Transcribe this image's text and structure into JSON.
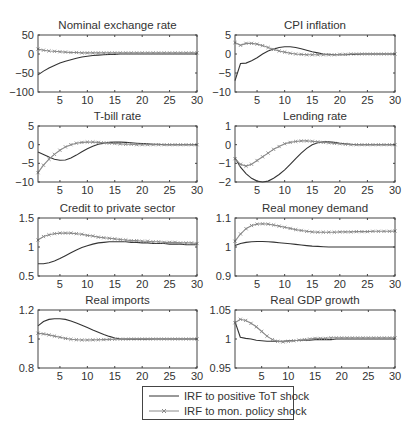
{
  "chart_data": [
    {
      "type": "line",
      "title": "Nominal exchange rate",
      "xlabel": "",
      "ylabel": "",
      "xlim": [
        1,
        30
      ],
      "ylim": [
        -100,
        50
      ],
      "xticks": [
        5,
        10,
        15,
        20,
        25,
        30
      ],
      "yticks": [
        50,
        0,
        -50,
        -100
      ],
      "grid": false,
      "x": [
        1,
        2,
        3,
        4,
        5,
        6,
        7,
        8,
        9,
        10,
        11,
        12,
        13,
        14,
        15,
        16,
        17,
        18,
        19,
        20,
        21,
        22,
        23,
        24,
        25,
        26,
        27,
        28,
        29,
        30
      ],
      "series": [
        {
          "name": "IRF to positive ToT shock",
          "style": "solid",
          "values": [
            -55,
            -45,
            -37,
            -30,
            -24,
            -19,
            -15,
            -11,
            -8,
            -6,
            -4,
            -3,
            -2,
            -1,
            -1,
            0,
            0,
            0,
            0,
            0,
            0,
            0,
            0,
            0,
            0,
            0,
            0,
            0,
            0,
            0
          ]
        },
        {
          "name": "IRF to mon. policy shock",
          "style": "x-marker",
          "values": [
            13,
            10,
            8,
            7,
            6,
            5,
            4,
            4,
            3,
            3,
            3,
            3,
            3,
            3,
            3,
            3,
            3,
            3,
            3,
            3,
            3,
            3,
            3,
            3,
            3,
            3,
            3,
            3,
            3,
            3
          ]
        }
      ]
    },
    {
      "type": "line",
      "title": "CPI inflation",
      "xlabel": "",
      "ylabel": "",
      "xlim": [
        1,
        30
      ],
      "ylim": [
        -10,
        5
      ],
      "xticks": [
        5,
        10,
        15,
        20,
        25,
        30
      ],
      "yticks": [
        5,
        0,
        -5,
        -10
      ],
      "grid": false,
      "x": [
        1,
        2,
        3,
        4,
        5,
        6,
        7,
        8,
        9,
        10,
        11,
        12,
        13,
        14,
        15,
        16,
        17,
        18,
        19,
        20,
        21,
        22,
        23,
        24,
        25,
        26,
        27,
        28,
        29,
        30
      ],
      "series": [
        {
          "name": "IRF to positive ToT shock",
          "style": "solid",
          "values": [
            -7,
            -2.5,
            -2.4,
            -1.8,
            -1,
            0,
            0.8,
            1.3,
            1.7,
            1.9,
            1.9,
            1.7,
            1.4,
            1,
            0.6,
            0.3,
            0,
            -0.1,
            -0.2,
            -0.2,
            -0.2,
            -0.1,
            -0.1,
            0,
            0,
            0,
            0,
            0,
            0,
            0
          ]
        },
        {
          "name": "IRF to mon. policy shock",
          "style": "x-marker",
          "values": [
            3,
            2.3,
            2.8,
            2.8,
            2.6,
            2.2,
            1.7,
            1.2,
            0.8,
            0.5,
            0.2,
            0,
            -0.1,
            -0.2,
            -0.2,
            -0.2,
            -0.2,
            -0.2,
            -0.2,
            -0.1,
            -0.1,
            0,
            0,
            0,
            0,
            0,
            0,
            0,
            0,
            0
          ]
        }
      ]
    },
    {
      "type": "line",
      "title": "T-bill rate",
      "xlabel": "",
      "ylabel": "",
      "xlim": [
        1,
        30
      ],
      "ylim": [
        -10,
        5
      ],
      "xticks": [
        5,
        10,
        15,
        20,
        25,
        30
      ],
      "yticks": [
        5,
        0,
        -5,
        -10
      ],
      "grid": false,
      "x": [
        1,
        2,
        3,
        4,
        5,
        6,
        7,
        8,
        9,
        10,
        11,
        12,
        13,
        14,
        15,
        16,
        17,
        18,
        19,
        20,
        21,
        22,
        23,
        24,
        25,
        26,
        27,
        28,
        29,
        30
      ],
      "series": [
        {
          "name": "IRF to positive ToT shock",
          "style": "solid",
          "values": [
            -2,
            -2.6,
            -3.3,
            -3.9,
            -4.2,
            -4.1,
            -3.6,
            -2.8,
            -1.9,
            -1.1,
            -0.4,
            0.1,
            0.4,
            0.6,
            0.7,
            0.7,
            0.6,
            0.5,
            0.4,
            0.3,
            0.2,
            0.1,
            0.1,
            0,
            0,
            0,
            0,
            0,
            0,
            0
          ]
        },
        {
          "name": "IRF to mon. policy shock",
          "style": "x-marker",
          "values": [
            -7.5,
            -5.5,
            -3.9,
            -2.6,
            -1.5,
            -0.6,
            0,
            0.4,
            0.6,
            0.7,
            0.7,
            0.6,
            0.5,
            0.4,
            0.3,
            0.2,
            0.1,
            0.1,
            0,
            0,
            0,
            0,
            0,
            0,
            0,
            0,
            0,
            0,
            0,
            0
          ]
        }
      ]
    },
    {
      "type": "line",
      "title": "Lending rate",
      "xlabel": "",
      "ylabel": "",
      "xlim": [
        1,
        30
      ],
      "ylim": [
        -2,
        1
      ],
      "xticks": [
        5,
        10,
        15,
        20,
        25,
        30
      ],
      "yticks": [
        1,
        0,
        -1,
        -2
      ],
      "grid": false,
      "x": [
        1,
        2,
        3,
        4,
        5,
        6,
        7,
        8,
        9,
        10,
        11,
        12,
        13,
        14,
        15,
        16,
        17,
        18,
        19,
        20,
        21,
        22,
        23,
        24,
        25,
        26,
        27,
        28,
        29,
        30
      ],
      "series": [
        {
          "name": "IRF to positive ToT shock",
          "style": "solid",
          "values": [
            -0.7,
            -1.2,
            -1.55,
            -1.8,
            -1.95,
            -2,
            -1.95,
            -1.8,
            -1.6,
            -1.35,
            -1.05,
            -0.75,
            -0.45,
            -0.2,
            0,
            0.1,
            0.15,
            0.15,
            0.12,
            0.08,
            0.05,
            0.02,
            0,
            0,
            0,
            0,
            0,
            0,
            0,
            0
          ]
        },
        {
          "name": "IRF to mon. policy shock",
          "style": "x-marker",
          "values": [
            -0.75,
            -1.05,
            -1.15,
            -1.05,
            -0.85,
            -0.65,
            -0.45,
            -0.25,
            -0.1,
            0.05,
            0.12,
            0.17,
            0.2,
            0.2,
            0.18,
            0.15,
            0.12,
            0.1,
            0.07,
            0.05,
            0.02,
            0,
            0,
            0,
            0,
            0,
            0,
            0,
            0,
            0
          ]
        }
      ]
    },
    {
      "type": "line",
      "title": "Credit to private sector",
      "xlabel": "",
      "ylabel": "",
      "xlim": [
        1,
        30
      ],
      "ylim": [
        0.5,
        1.5
      ],
      "xticks": [
        5,
        10,
        15,
        20,
        25,
        30
      ],
      "yticks": [
        1.5,
        1,
        0.5
      ],
      "grid": false,
      "x": [
        1,
        2,
        3,
        4,
        5,
        6,
        7,
        8,
        9,
        10,
        11,
        12,
        13,
        14,
        15,
        16,
        17,
        18,
        19,
        20,
        21,
        22,
        23,
        24,
        25,
        26,
        27,
        28,
        29,
        30
      ],
      "series": [
        {
          "name": "IRF to positive ToT shock",
          "style": "solid",
          "values": [
            0.71,
            0.71,
            0.73,
            0.76,
            0.8,
            0.85,
            0.9,
            0.95,
            0.99,
            1.02,
            1.05,
            1.07,
            1.08,
            1.09,
            1.09,
            1.09,
            1.09,
            1.08,
            1.08,
            1.07,
            1.07,
            1.06,
            1.06,
            1.06,
            1.05,
            1.05,
            1.05,
            1.04,
            1.04,
            1.04
          ]
        },
        {
          "name": "IRF to mon. policy shock",
          "style": "x-marker",
          "values": [
            1.12,
            1.18,
            1.21,
            1.23,
            1.24,
            1.24,
            1.24,
            1.23,
            1.22,
            1.2,
            1.19,
            1.17,
            1.16,
            1.15,
            1.14,
            1.13,
            1.12,
            1.11,
            1.11,
            1.1,
            1.1,
            1.09,
            1.09,
            1.08,
            1.08,
            1.08,
            1.07,
            1.07,
            1.07,
            1.06
          ]
        }
      ]
    },
    {
      "type": "line",
      "title": "Real money demand",
      "xlabel": "",
      "ylabel": "",
      "xlim": [
        1,
        30
      ],
      "ylim": [
        0.9,
        1.1
      ],
      "xticks": [
        5,
        10,
        15,
        20,
        25,
        30
      ],
      "yticks": [
        1.1,
        1,
        0.9
      ],
      "grid": false,
      "x": [
        1,
        2,
        3,
        4,
        5,
        6,
        7,
        8,
        9,
        10,
        11,
        12,
        13,
        14,
        15,
        16,
        17,
        18,
        19,
        20,
        21,
        22,
        23,
        24,
        25,
        26,
        27,
        28,
        29,
        30
      ],
      "series": [
        {
          "name": "IRF to positive ToT shock",
          "style": "solid",
          "values": [
            1.005,
            1.012,
            1.016,
            1.018,
            1.019,
            1.019,
            1.018,
            1.017,
            1.015,
            1.013,
            1.011,
            1.009,
            1.007,
            1.005,
            1.003,
            1.002,
            1.001,
            1.0,
            1.0,
            1.0,
            1.0,
            1.0,
            1.0,
            1.0,
            1.0,
            1.0,
            1.0,
            1.0,
            1.0,
            1.0
          ]
        },
        {
          "name": "IRF to mon. policy shock",
          "style": "x-marker",
          "values": [
            1.02,
            1.045,
            1.063,
            1.074,
            1.079,
            1.08,
            1.079,
            1.076,
            1.072,
            1.068,
            1.064,
            1.06,
            1.057,
            1.054,
            1.052,
            1.051,
            1.051,
            1.051,
            1.051,
            1.052,
            1.052,
            1.052,
            1.053,
            1.053,
            1.053,
            1.054,
            1.054,
            1.054,
            1.054,
            1.055
          ]
        }
      ]
    },
    {
      "type": "line",
      "title": "Real imports",
      "xlabel": "",
      "ylabel": "",
      "xlim": [
        1,
        30
      ],
      "ylim": [
        0.8,
        1.2
      ],
      "xticks": [
        5,
        10,
        15,
        20,
        25,
        30
      ],
      "yticks": [
        1.2,
        1,
        0.8
      ],
      "grid": false,
      "x": [
        1,
        2,
        3,
        4,
        5,
        6,
        7,
        8,
        9,
        10,
        11,
        12,
        13,
        14,
        15,
        16,
        17,
        18,
        19,
        20,
        21,
        22,
        23,
        24,
        25,
        26,
        27,
        28,
        29,
        30
      ],
      "series": [
        {
          "name": "IRF to positive ToT shock",
          "style": "solid",
          "values": [
            1.09,
            1.12,
            1.135,
            1.14,
            1.14,
            1.135,
            1.125,
            1.11,
            1.095,
            1.08,
            1.063,
            1.047,
            1.032,
            1.018,
            1.007,
            1.001,
            0.999,
            0.999,
            0.999,
            0.999,
            0.999,
            1.0,
            1.0,
            1.0,
            1.0,
            1.0,
            1.0,
            1.0,
            1.0,
            1.0
          ]
        },
        {
          "name": "IRF to mon. policy shock",
          "style": "x-marker",
          "values": [
            1.04,
            1.035,
            1.028,
            1.02,
            1.012,
            1.004,
            0.998,
            0.995,
            0.993,
            0.993,
            0.994,
            0.995,
            0.996,
            0.997,
            0.998,
            0.999,
            0.999,
            1.0,
            1.0,
            1.0,
            1.0,
            1.0,
            1.0,
            1.0,
            1.0,
            1.0,
            1.0,
            1.0,
            1.0,
            1.0
          ]
        }
      ]
    },
    {
      "type": "line",
      "title": "Real GDP growth",
      "xlabel": "",
      "ylabel": "",
      "xlim": [
        0,
        30
      ],
      "ylim": [
        0.95,
        1.05
      ],
      "xticks": [
        5,
        10,
        15,
        20,
        25,
        30
      ],
      "yticks": [
        1.05,
        1,
        0.95
      ],
      "grid": false,
      "x": [
        0,
        1,
        2,
        3,
        4,
        5,
        6,
        7,
        8,
        9,
        10,
        11,
        12,
        13,
        14,
        15,
        16,
        17,
        18,
        19,
        20,
        21,
        22,
        23,
        24,
        25,
        26,
        27,
        28,
        29,
        30
      ],
      "series": [
        {
          "name": "IRF to positive ToT shock",
          "style": "solid",
          "values": [
            1.03,
            1.003,
            1.001,
            1.0,
            0.998,
            0.997,
            0.996,
            0.996,
            0.996,
            0.996,
            0.997,
            0.997,
            0.998,
            0.998,
            0.998,
            0.999,
            0.999,
            0.999,
            0.999,
            1.0,
            1.0,
            1.0,
            1.0,
            1.0,
            1.0,
            1.0,
            1.0,
            1.0,
            1.0,
            1.0,
            1.0
          ]
        },
        {
          "name": "IRF to mon. policy shock",
          "style": "x-marker",
          "values": [
            1.028,
            1.034,
            1.032,
            1.027,
            1.021,
            1.013,
            1.005,
            0.999,
            0.996,
            0.995,
            0.996,
            0.997,
            0.998,
            0.999,
            1.0,
            1.001,
            1.001,
            1.001,
            1.002,
            1.002,
            1.002,
            1.002,
            1.002,
            1.002,
            1.002,
            1.002,
            1.002,
            1.002,
            1.002,
            1.002,
            1.002
          ]
        }
      ]
    }
  ],
  "legend": {
    "position": "bottom-center",
    "entries": [
      {
        "label": "IRF to positive ToT shock",
        "style": "solid"
      },
      {
        "label": "IRF to mon. policy shock",
        "style": "x-marker"
      }
    ]
  },
  "colors": {
    "tot_line": "#333333",
    "policy_line": "#8a8a8a",
    "axis": "#444444",
    "text": "#333333"
  }
}
